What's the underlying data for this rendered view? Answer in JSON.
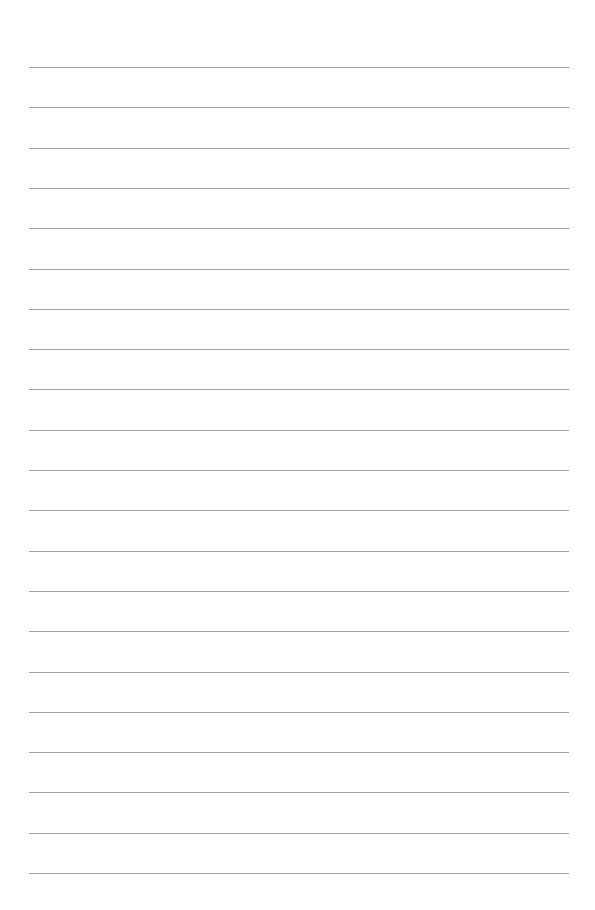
{
  "page": {
    "type": "lined-paper",
    "background_color": "#ffffff",
    "line_color": "#a3a3a3",
    "line_count": 21,
    "first_line_y": 67,
    "line_spacing": 40.3,
    "line_left": 29,
    "line_width": 540,
    "lines": [
      {
        "text": ""
      },
      {
        "text": ""
      },
      {
        "text": ""
      },
      {
        "text": ""
      },
      {
        "text": ""
      },
      {
        "text": ""
      },
      {
        "text": ""
      },
      {
        "text": ""
      },
      {
        "text": ""
      },
      {
        "text": ""
      },
      {
        "text": ""
      },
      {
        "text": ""
      },
      {
        "text": ""
      },
      {
        "text": ""
      },
      {
        "text": ""
      },
      {
        "text": ""
      },
      {
        "text": ""
      },
      {
        "text": ""
      },
      {
        "text": ""
      },
      {
        "text": ""
      },
      {
        "text": ""
      }
    ]
  }
}
